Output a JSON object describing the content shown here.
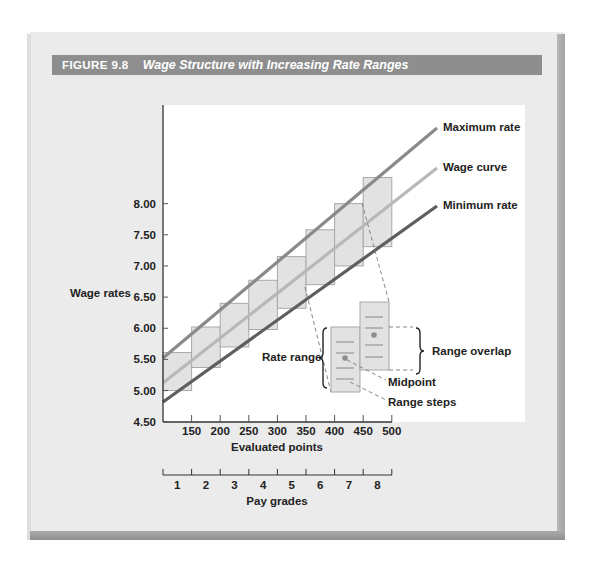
{
  "figure": {
    "number": "FIGURE 9.8",
    "title": "Wage Structure with Increasing Rate Ranges"
  },
  "chart_data": {
    "type": "bar",
    "subtype": "floating-range-boxes-with-lines",
    "title": "Wage Structure with Increasing Rate Ranges",
    "xlabel": "Evaluated points",
    "ylabel": "Wage rates",
    "secondary_xlabel": "Pay grades",
    "ylim": [
      4.5,
      8.5
    ],
    "y_ticks": [
      "4.50",
      "5.00",
      "5.50",
      "6.00",
      "6.50",
      "7.00",
      "7.50",
      "8.00"
    ],
    "x_ticks": [
      "150",
      "200",
      "250",
      "300",
      "350",
      "400",
      "450",
      "500"
    ],
    "categories": [
      "1",
      "2",
      "3",
      "4",
      "5",
      "6",
      "7",
      "8"
    ],
    "grade_point_ranges": [
      [
        100,
        150
      ],
      [
        150,
        200
      ],
      [
        200,
        250
      ],
      [
        250,
        300
      ],
      [
        300,
        350
      ],
      [
        350,
        400
      ],
      [
        400,
        450
      ],
      [
        450,
        500
      ]
    ],
    "rate_ranges": [
      {
        "grade": "1",
        "min": 5.0,
        "max": 5.61
      },
      {
        "grade": "2",
        "min": 5.37,
        "max": 6.02
      },
      {
        "grade": "3",
        "min": 5.7,
        "max": 6.4
      },
      {
        "grade": "4",
        "min": 5.98,
        "max": 6.77
      },
      {
        "grade": "5",
        "min": 6.32,
        "max": 7.15
      },
      {
        "grade": "6",
        "min": 6.7,
        "max": 7.58
      },
      {
        "grade": "7",
        "min": 7.0,
        "max": 8.0
      },
      {
        "grade": "8",
        "min": 7.31,
        "max": 8.42
      }
    ],
    "series": [
      {
        "name": "Maximum rate",
        "x": [
          100,
          500
        ],
        "values": [
          5.39,
          9.8
        ],
        "color": "#8a8a8a"
      },
      {
        "name": "Wage curve",
        "x": [
          100,
          500
        ],
        "values": [
          5.1,
          9.15
        ],
        "color": "#b5b5b5"
      },
      {
        "name": "Minimum rate",
        "x": [
          100,
          500
        ],
        "values": [
          4.8,
          8.5
        ],
        "color": "#5e5e5e"
      }
    ],
    "annotations": [
      "Rate range",
      "Range overlap",
      "Midpoint",
      "Range steps"
    ],
    "grid": false,
    "legend_position": "right (direct labels)"
  },
  "labels": {
    "max_rate": "Maximum rate",
    "wage_curve": "Wage curve",
    "min_rate": "Minimum rate",
    "rate_range": "Rate range",
    "range_overlap": "Range overlap",
    "midpoint": "Midpoint",
    "range_steps": "Range steps",
    "y_axis": "Wage rates",
    "x_axis": "Evaluated points",
    "pay_grades": "Pay grades"
  },
  "colors": {
    "title_bar": "#8e8e8e",
    "panel": "#ebebeb",
    "box_fill": "#e2e2e2",
    "box_stroke": "#a8a8a8"
  }
}
